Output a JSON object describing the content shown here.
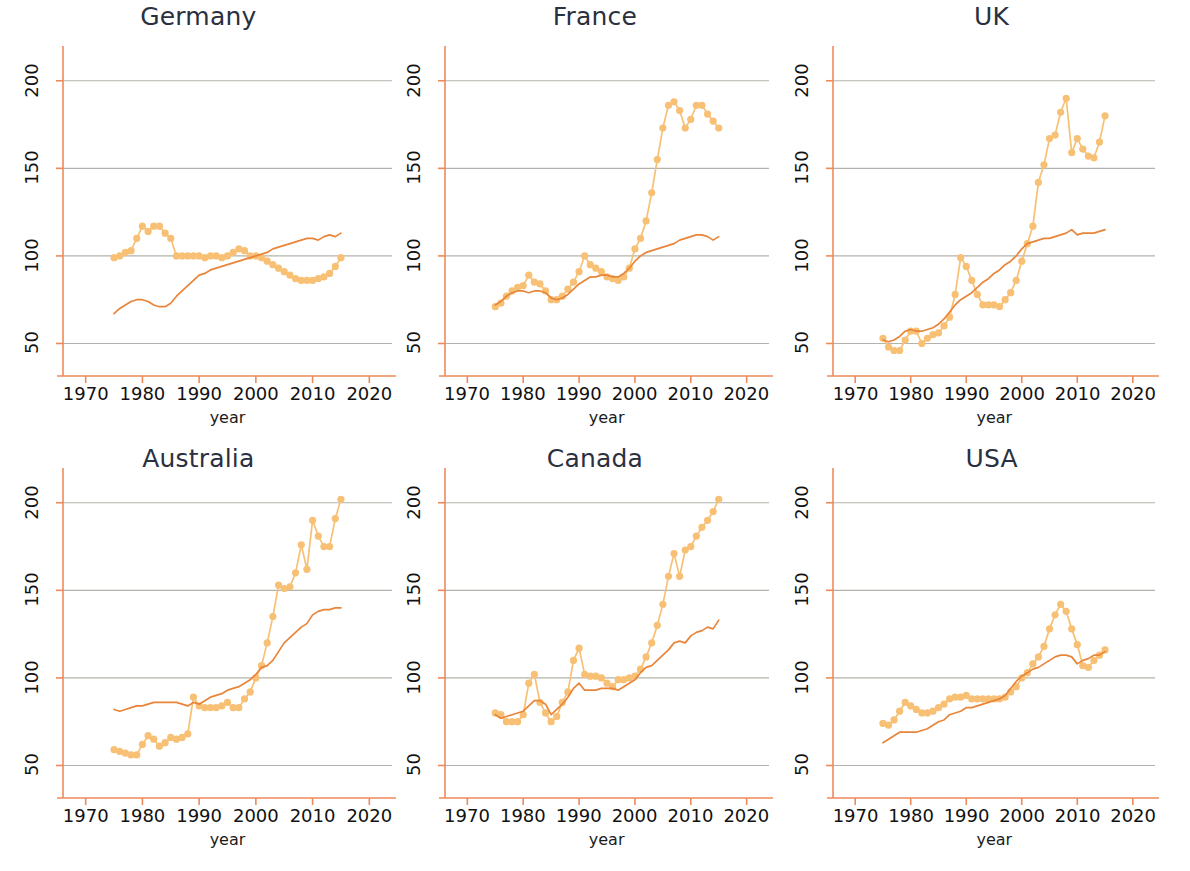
{
  "figure": {
    "layout": "2x3 small multiples",
    "xlabel": "year",
    "background": "#ffffff",
    "colors": {
      "marker_series": "#f7c074",
      "line_series": "#e8853a",
      "axis": "#ee8a5a",
      "grid": "#9a9a92",
      "title_text": "#2b3040",
      "tick_text": "#111111"
    }
  },
  "axes": {
    "xticks": [
      1970,
      1980,
      1990,
      2000,
      2010,
      2020
    ],
    "yticks": [
      50,
      100,
      150,
      200
    ],
    "xlim": [
      1966,
      2024
    ],
    "ylim": [
      36,
      213
    ]
  },
  "chart_data": [
    {
      "type": "line",
      "title": "Germany",
      "xlabel": "year",
      "ylabel": "",
      "xlim": [
        1966,
        2024
      ],
      "ylim": [
        36,
        213
      ],
      "grid": true,
      "legend": "none",
      "x": [
        1975,
        1976,
        1977,
        1978,
        1979,
        1980,
        1981,
        1982,
        1983,
        1984,
        1985,
        1986,
        1987,
        1988,
        1989,
        1990,
        1991,
        1992,
        1993,
        1994,
        1995,
        1996,
        1997,
        1998,
        1999,
        2000,
        2001,
        2002,
        2003,
        2004,
        2005,
        2006,
        2007,
        2008,
        2009,
        2010,
        2011,
        2012,
        2013,
        2014,
        2015
      ],
      "series": [
        {
          "name": "real house price index",
          "style": "markers+line",
          "values": [
            99,
            100,
            102,
            103,
            110,
            117,
            114,
            117,
            117,
            113,
            110,
            100,
            100,
            100,
            100,
            100,
            99,
            100,
            100,
            99,
            100,
            102,
            104,
            103,
            100,
            100,
            99,
            97,
            95,
            93,
            91,
            89,
            87,
            86,
            86,
            86,
            87,
            88,
            90,
            94,
            99
          ]
        },
        {
          "name": "income / fundamentals index",
          "style": "line",
          "values": [
            67,
            70,
            72,
            74,
            75,
            75,
            74,
            72,
            71,
            71,
            73,
            77,
            80,
            83,
            86,
            89,
            90,
            92,
            93,
            94,
            95,
            96,
            97,
            98,
            99,
            100,
            101,
            102,
            104,
            105,
            106,
            107,
            108,
            109,
            110,
            110,
            109,
            111,
            112,
            111,
            113
          ]
        }
      ]
    },
    {
      "type": "line",
      "title": "France",
      "xlabel": "year",
      "ylabel": "",
      "xlim": [
        1966,
        2024
      ],
      "ylim": [
        36,
        213
      ],
      "grid": true,
      "legend": "none",
      "x": [
        1975,
        1976,
        1977,
        1978,
        1979,
        1980,
        1981,
        1982,
        1983,
        1984,
        1985,
        1986,
        1987,
        1988,
        1989,
        1990,
        1991,
        1992,
        1993,
        1994,
        1995,
        1996,
        1997,
        1998,
        1999,
        2000,
        2001,
        2002,
        2003,
        2004,
        2005,
        2006,
        2007,
        2008,
        2009,
        2010,
        2011,
        2012,
        2013,
        2014,
        2015
      ],
      "series": [
        {
          "name": "real house price index",
          "style": "markers+line",
          "values": [
            71,
            73,
            77,
            80,
            82,
            83,
            89,
            85,
            84,
            80,
            75,
            75,
            77,
            81,
            85,
            91,
            100,
            95,
            93,
            91,
            88,
            87,
            86,
            88,
            93,
            104,
            110,
            120,
            136,
            155,
            173,
            186,
            188,
            183,
            173,
            178,
            186,
            186,
            181,
            177,
            173
          ]
        },
        {
          "name": "income / fundamentals index",
          "style": "line",
          "values": [
            72,
            74,
            77,
            79,
            80,
            80,
            79,
            80,
            80,
            79,
            76,
            75,
            76,
            78,
            81,
            84,
            86,
            88,
            88,
            89,
            89,
            88,
            88,
            90,
            93,
            97,
            100,
            102,
            103,
            104,
            105,
            106,
            107,
            109,
            110,
            111,
            112,
            112,
            111,
            109,
            111
          ]
        }
      ]
    },
    {
      "type": "line",
      "title": "UK",
      "xlabel": "year",
      "ylabel": "",
      "xlim": [
        1966,
        2024
      ],
      "ylim": [
        36,
        213
      ],
      "grid": true,
      "legend": "none",
      "x": [
        1975,
        1976,
        1977,
        1978,
        1979,
        1980,
        1981,
        1982,
        1983,
        1984,
        1985,
        1986,
        1987,
        1988,
        1989,
        1990,
        1991,
        1992,
        1993,
        1994,
        1995,
        1996,
        1997,
        1998,
        1999,
        2000,
        2001,
        2002,
        2003,
        2004,
        2005,
        2006,
        2007,
        2008,
        2009,
        2010,
        2011,
        2012,
        2013,
        2014,
        2015
      ],
      "series": [
        {
          "name": "real house price index",
          "style": "markers+line",
          "values": [
            53,
            48,
            46,
            46,
            52,
            57,
            57,
            50,
            53,
            55,
            56,
            60,
            65,
            78,
            99,
            94,
            86,
            78,
            72,
            72,
            72,
            71,
            75,
            79,
            86,
            97,
            107,
            117,
            142,
            152,
            167,
            169,
            182,
            190,
            159,
            167,
            161,
            157,
            156,
            165,
            180
          ]
        },
        {
          "name": "income / fundamentals index",
          "style": "line",
          "values": [
            52,
            51,
            52,
            54,
            57,
            58,
            57,
            57,
            58,
            59,
            61,
            64,
            68,
            72,
            75,
            77,
            79,
            82,
            85,
            87,
            90,
            92,
            95,
            97,
            100,
            104,
            107,
            108,
            109,
            110,
            110,
            111,
            112,
            113,
            115,
            112,
            113,
            113,
            113,
            114,
            115
          ]
        }
      ]
    },
    {
      "type": "line",
      "title": "Australia",
      "xlabel": "year",
      "ylabel": "",
      "xlim": [
        1966,
        2024
      ],
      "ylim": [
        36,
        213
      ],
      "grid": true,
      "legend": "none",
      "x": [
        1975,
        1976,
        1977,
        1978,
        1979,
        1980,
        1981,
        1982,
        1983,
        1984,
        1985,
        1986,
        1987,
        1988,
        1989,
        1990,
        1991,
        1992,
        1993,
        1994,
        1995,
        1996,
        1997,
        1998,
        1999,
        2000,
        2001,
        2002,
        2003,
        2004,
        2005,
        2006,
        2007,
        2008,
        2009,
        2010,
        2011,
        2012,
        2013,
        2014,
        2015
      ],
      "series": [
        {
          "name": "real house price index",
          "style": "markers+line",
          "values": [
            59,
            58,
            57,
            56,
            56,
            62,
            67,
            65,
            61,
            63,
            66,
            65,
            66,
            68,
            89,
            84,
            83,
            83,
            83,
            84,
            86,
            83,
            83,
            88,
            92,
            100,
            107,
            120,
            135,
            153,
            151,
            152,
            160,
            176,
            162,
            190,
            181,
            175,
            175,
            191,
            202
          ]
        },
        {
          "name": "income / fundamentals index",
          "style": "line",
          "values": [
            82,
            81,
            82,
            83,
            84,
            84,
            85,
            86,
            86,
            86,
            86,
            86,
            85,
            84,
            86,
            85,
            87,
            89,
            90,
            91,
            93,
            94,
            95,
            97,
            99,
            102,
            106,
            107,
            110,
            115,
            120,
            123,
            126,
            129,
            131,
            136,
            138,
            139,
            139,
            140,
            140
          ]
        }
      ]
    },
    {
      "type": "line",
      "title": "Canada",
      "xlabel": "year",
      "ylabel": "",
      "xlim": [
        1966,
        2024
      ],
      "ylim": [
        36,
        213
      ],
      "grid": true,
      "legend": "none",
      "x": [
        1975,
        1976,
        1977,
        1978,
        1979,
        1980,
        1981,
        1982,
        1983,
        1984,
        1985,
        1986,
        1987,
        1988,
        1989,
        1990,
        1991,
        1992,
        1993,
        1994,
        1995,
        1996,
        1997,
        1998,
        1999,
        2000,
        2001,
        2002,
        2003,
        2004,
        2005,
        2006,
        2007,
        2008,
        2009,
        2010,
        2011,
        2012,
        2013,
        2014,
        2015
      ],
      "series": [
        {
          "name": "real house price index",
          "style": "markers+line",
          "values": [
            80,
            79,
            75,
            75,
            75,
            79,
            97,
            102,
            86,
            80,
            75,
            78,
            86,
            92,
            110,
            117,
            102,
            101,
            101,
            100,
            97,
            95,
            99,
            99,
            100,
            101,
            105,
            112,
            120,
            130,
            142,
            158,
            171,
            158,
            173,
            175,
            181,
            186,
            190,
            195,
            202
          ]
        },
        {
          "name": "income / fundamentals index",
          "style": "line",
          "values": [
            79,
            77,
            78,
            79,
            80,
            81,
            84,
            87,
            87,
            85,
            79,
            82,
            85,
            89,
            94,
            97,
            93,
            93,
            93,
            94,
            94,
            94,
            93,
            95,
            97,
            99,
            103,
            106,
            107,
            110,
            113,
            116,
            120,
            121,
            120,
            124,
            126,
            127,
            129,
            128,
            133
          ]
        }
      ]
    },
    {
      "type": "line",
      "title": "USA",
      "xlabel": "year",
      "ylabel": "",
      "xlim": [
        1966,
        2024
      ],
      "ylim": [
        36,
        213
      ],
      "grid": true,
      "legend": "none",
      "x": [
        1975,
        1976,
        1977,
        1978,
        1979,
        1980,
        1981,
        1982,
        1983,
        1984,
        1985,
        1986,
        1987,
        1988,
        1989,
        1990,
        1991,
        1992,
        1993,
        1994,
        1995,
        1996,
        1997,
        1998,
        1999,
        2000,
        2001,
        2002,
        2003,
        2004,
        2005,
        2006,
        2007,
        2008,
        2009,
        2010,
        2011,
        2012,
        2013,
        2014,
        2015
      ],
      "series": [
        {
          "name": "real house price index",
          "style": "markers+line",
          "values": [
            74,
            73,
            76,
            81,
            86,
            84,
            82,
            80,
            80,
            81,
            83,
            85,
            88,
            89,
            89,
            90,
            88,
            88,
            88,
            88,
            88,
            88,
            89,
            92,
            95,
            100,
            103,
            108,
            112,
            118,
            128,
            136,
            142,
            138,
            128,
            119,
            107,
            106,
            110,
            113,
            116
          ]
        },
        {
          "name": "income / fundamentals index",
          "style": "line",
          "values": [
            63,
            65,
            67,
            69,
            69,
            69,
            69,
            70,
            71,
            73,
            75,
            76,
            79,
            80,
            81,
            83,
            83,
            84,
            85,
            86,
            87,
            88,
            90,
            94,
            98,
            101,
            103,
            105,
            106,
            108,
            110,
            112,
            113,
            113,
            112,
            108,
            110,
            111,
            113,
            113,
            115
          ]
        }
      ]
    }
  ]
}
